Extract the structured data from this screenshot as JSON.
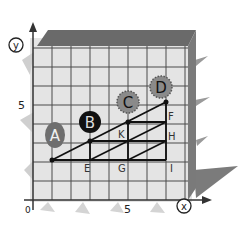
{
  "diagram": {
    "type": "coordinate-grid-illustration",
    "axes": {
      "x_label": "x",
      "y_label": "y",
      "origin_label": "0",
      "x_tick_label": "5",
      "y_tick_label": "5"
    },
    "points": [
      {
        "id": "A",
        "label": "A",
        "grid": [
          1,
          2
        ],
        "style": "gray-oval"
      },
      {
        "id": "B",
        "label": "B",
        "grid": [
          3,
          3
        ],
        "style": "black-oval"
      },
      {
        "id": "C",
        "label": "C",
        "grid": [
          5,
          4
        ],
        "style": "gray-dotted-circle"
      },
      {
        "id": "D",
        "label": "D",
        "grid": [
          7,
          5
        ],
        "style": "gray-dotted-circle"
      }
    ],
    "letters": [
      {
        "label": "E",
        "grid": [
          3,
          2
        ]
      },
      {
        "label": "G",
        "grid": [
          5,
          2
        ]
      },
      {
        "label": "I",
        "grid": [
          7,
          2
        ]
      },
      {
        "label": "K",
        "grid": [
          5,
          3
        ]
      },
      {
        "label": "H",
        "grid": [
          7,
          3
        ]
      },
      {
        "label": "F",
        "grid": [
          7,
          4
        ]
      }
    ],
    "colors": {
      "grid_line": "#4a4a4a",
      "box_top": "#6a6a6a",
      "box_side": "#7a7a7a",
      "fill": "#e2e2e2",
      "oval_gray": "#6e6e6e",
      "oval_black": "#111111",
      "circle_gray": "#8a8a8a"
    }
  }
}
